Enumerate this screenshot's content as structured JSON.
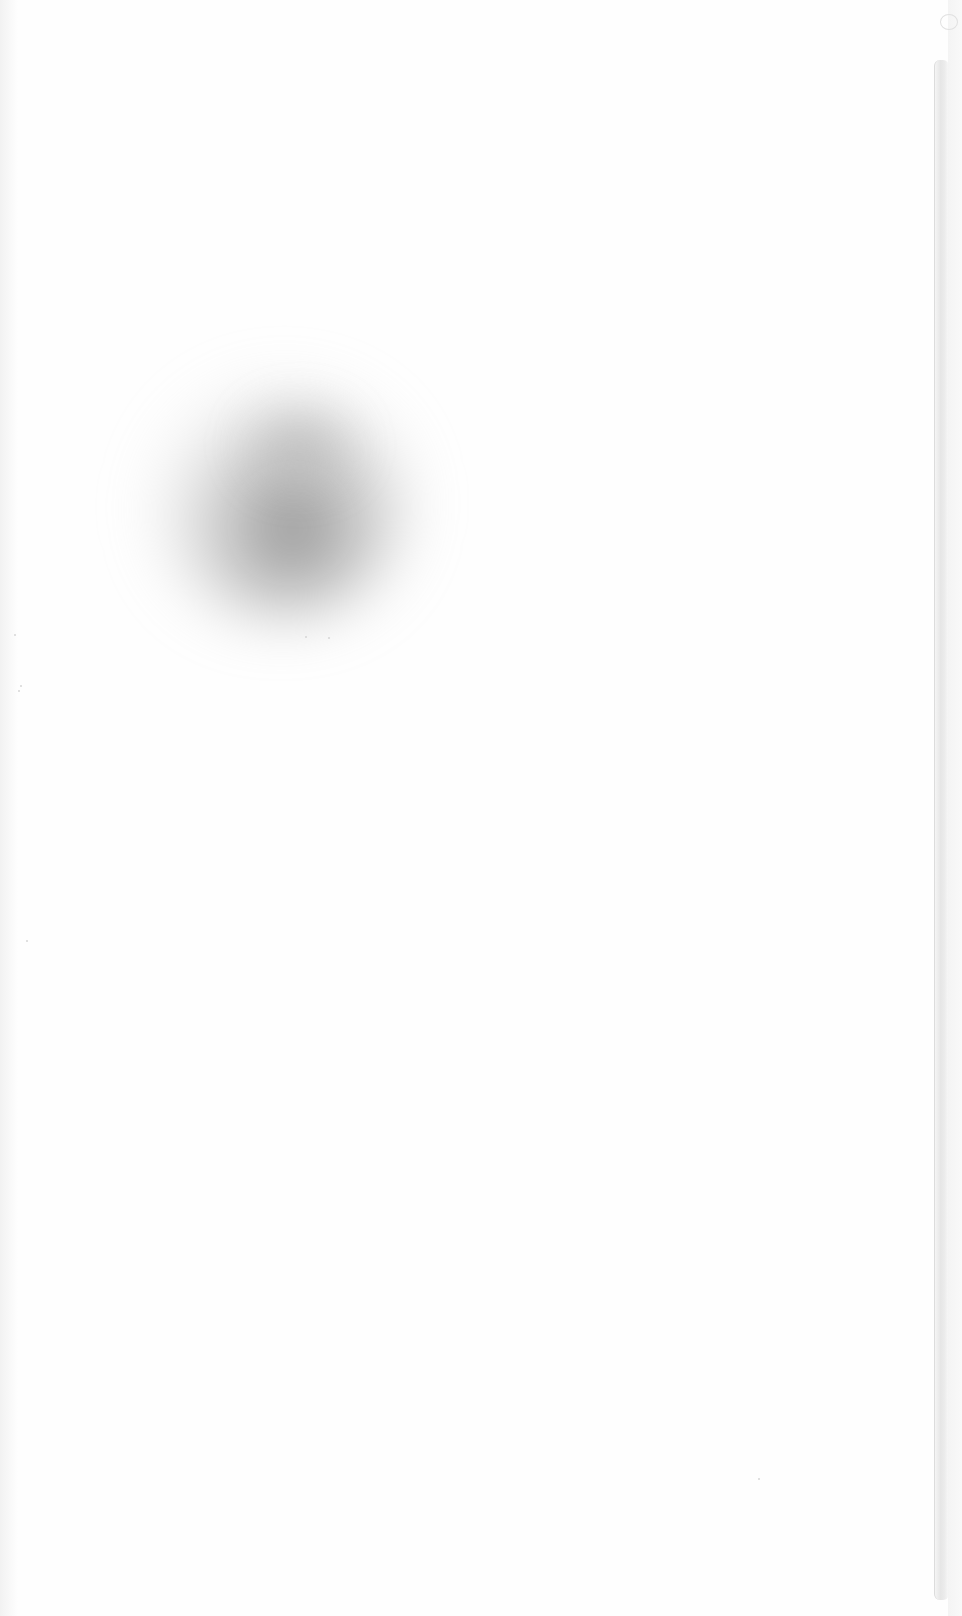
{
  "document": {
    "type": "scanned-page",
    "content_text": "",
    "background_color": "#fefefe",
    "artifacts": [
      {
        "kind": "smudge",
        "color": "#8a8a8a"
      },
      {
        "kind": "binding-edge-shadow",
        "side": "right",
        "color": "#e6e6e6"
      }
    ]
  }
}
